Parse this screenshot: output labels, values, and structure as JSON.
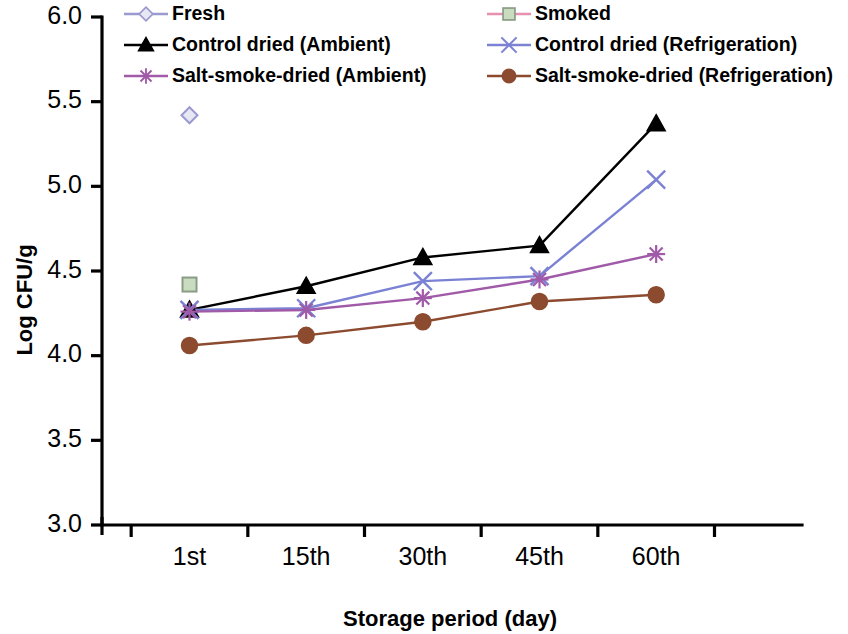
{
  "chart_data": {
    "type": "line",
    "title": "",
    "xlabel": "Storage period (day)",
    "ylabel": "Log CFU/g",
    "categories": [
      "1st",
      "15th",
      "30th",
      "45th",
      "60th"
    ],
    "ylim": [
      3.0,
      6.0
    ],
    "yticks": [
      "3.0",
      "3.5",
      "4.0",
      "4.5",
      "5.0",
      "5.5",
      "6.0"
    ],
    "ytick_values": [
      3.0,
      3.5,
      4.0,
      4.5,
      5.0,
      5.5,
      6.0
    ],
    "grid": false,
    "legend_position": "top",
    "series": [
      {
        "name": "Fresh",
        "color": "#9a9ad0",
        "marker": "diamond-open",
        "marker_fill": "#e8e8f5",
        "values": [
          5.42,
          null,
          null,
          null,
          null
        ]
      },
      {
        "name": "Smoked",
        "color": "#e78fb0",
        "marker": "square",
        "marker_fill": "#c9dcc0",
        "values": [
          4.42,
          null,
          null,
          null,
          null
        ]
      },
      {
        "name": "Control dried (Ambient)",
        "color": "#000000",
        "marker": "triangle",
        "marker_fill": "#000000",
        "values": [
          4.27,
          4.41,
          4.58,
          4.65,
          5.37
        ]
      },
      {
        "name": "Control dried (Refrigeration)",
        "color": "#7b82d4",
        "marker": "cross-x",
        "marker_fill": "#7b82d4",
        "values": [
          4.27,
          4.28,
          4.44,
          4.47,
          5.04
        ]
      },
      {
        "name": "Salt-smoke-dried (Ambient)",
        "color": "#a05aa8",
        "marker": "star",
        "marker_fill": "#a05aa8",
        "values": [
          4.26,
          4.27,
          4.34,
          4.45,
          4.6
        ]
      },
      {
        "name": "Salt-smoke-dried (Refrigeration)",
        "color": "#8c4a2f",
        "marker": "circle",
        "marker_fill": "#8c4a2f",
        "values": [
          4.06,
          4.12,
          4.2,
          4.32,
          4.36
        ]
      }
    ]
  },
  "legend": {
    "entries": [
      {
        "label": "Fresh"
      },
      {
        "label": "Smoked"
      },
      {
        "label": "Control dried (Ambient)"
      },
      {
        "label": "Control dried (Refrigeration)"
      },
      {
        "label": "Salt-smoke-dried (Ambient)"
      },
      {
        "label": "Salt-smoke-dried (Refrigeration)"
      }
    ]
  }
}
